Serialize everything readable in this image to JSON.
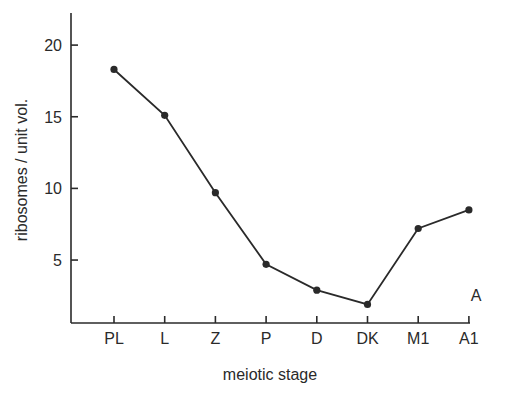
{
  "chart_data": {
    "type": "line",
    "title": "",
    "panel_label": "A",
    "xlabel": "meiotic stage",
    "ylabel": "ribosomes / unit vol.",
    "categories": [
      "PL",
      "L",
      "Z",
      "P",
      "D",
      "DK",
      "M1",
      "A1"
    ],
    "series": [
      {
        "name": "ribosomes",
        "values": [
          18.3,
          15.1,
          9.7,
          4.7,
          2.9,
          1.9,
          7.2,
          8.5
        ]
      }
    ],
    "yticks": [
      5,
      10,
      15,
      20
    ],
    "ylim": [
      0,
      22
    ],
    "grid": false,
    "legend": "none"
  },
  "labels": {
    "panel": "A",
    "xlabel": "meiotic stage",
    "ylabel": "ribosomes / unit vol.",
    "yticks": [
      "5",
      "10",
      "15",
      "20"
    ],
    "xticks": [
      "PL",
      "L",
      "Z",
      "P",
      "D",
      "DK",
      "M1",
      "A1"
    ]
  }
}
